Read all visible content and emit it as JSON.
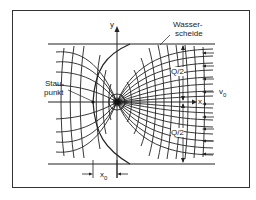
{
  "figure": {
    "labels": {
      "y_axis": "y",
      "x_axis": "x",
      "watershed_line1": "Wasser-",
      "watershed_line2": "scheide",
      "stagnation_line1": "Stau-",
      "stagnation_line2": "punkt",
      "velocity": "v",
      "velocity_sub": "0",
      "half_flow_upper": "Q/2",
      "half_flow_lower": "Q/2",
      "distance": "x",
      "distance_sub": "0"
    },
    "colors": {
      "line": "#222222",
      "background": "#ffffff",
      "frame": "#333333"
    }
  }
}
